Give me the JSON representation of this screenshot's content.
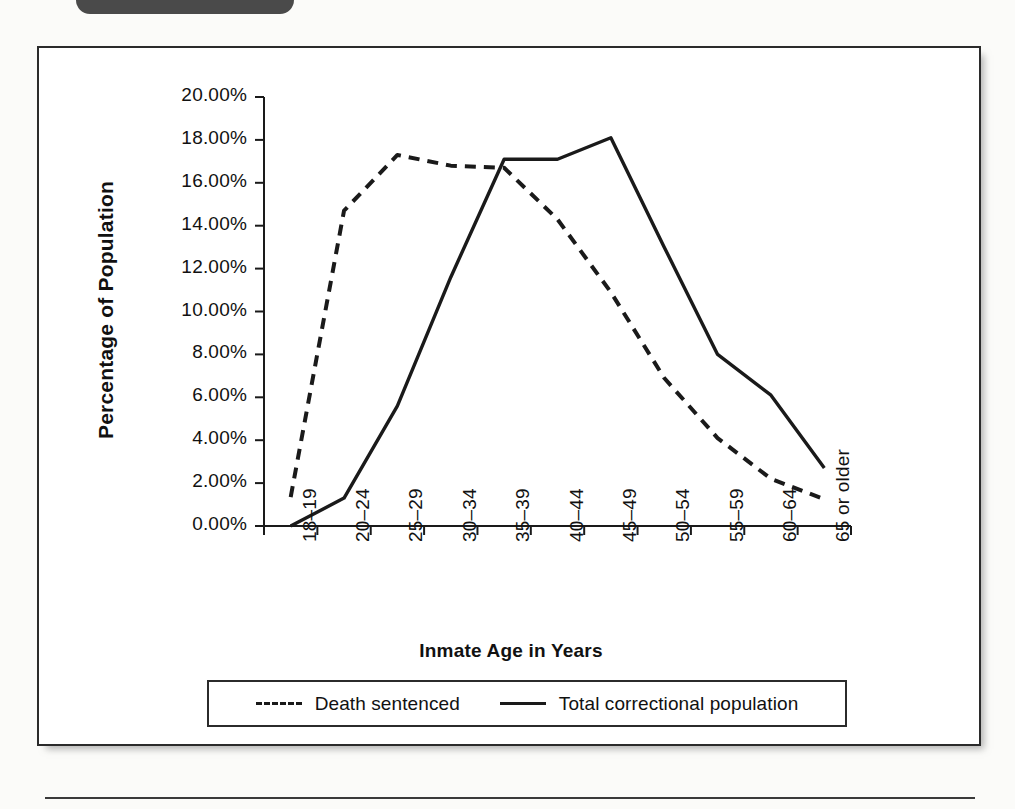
{
  "page": {
    "running_head": "",
    "corner_tab_label": ""
  },
  "chart_data": {
    "type": "line",
    "title": "",
    "xlabel": "Inmate Age in Years",
    "ylabel": "Percentage of Population",
    "categories": [
      "18–19",
      "20–24",
      "25–29",
      "30–34",
      "35–39",
      "40–44",
      "45–49",
      "50–54",
      "55–59",
      "60–64",
      "65 or older"
    ],
    "ylim": [
      0,
      20
    ],
    "ytick_labels": [
      "20.00%",
      "18.00%",
      "16.00%",
      "14.00%",
      "12.00%",
      "10.00%",
      "8.00%",
      "6.00%",
      "4.00%",
      "2.00%",
      "0.00%"
    ],
    "ytick_values": [
      20,
      18,
      16,
      14,
      12,
      10,
      8,
      6,
      4,
      2,
      0
    ],
    "grid": false,
    "legend_position": "bottom",
    "series": [
      {
        "name": "Death sentenced",
        "style": "dashed",
        "color": "#1a1a1a",
        "values": [
          1.35,
          14.7,
          17.3,
          16.8,
          16.7,
          14.3,
          10.9,
          6.9,
          4.1,
          2.2,
          1.25
        ]
      },
      {
        "name": "Total correctional population",
        "style": "solid",
        "color": "#1a1a1a",
        "values": [
          0.0,
          1.3,
          5.6,
          11.6,
          17.1,
          17.1,
          18.1,
          13.0,
          8.0,
          6.1,
          2.7
        ]
      }
    ]
  },
  "legend": {
    "entries": [
      {
        "label": "Death sentenced",
        "style": "dashed"
      },
      {
        "label": "Total correctional population",
        "style": "solid"
      }
    ]
  }
}
